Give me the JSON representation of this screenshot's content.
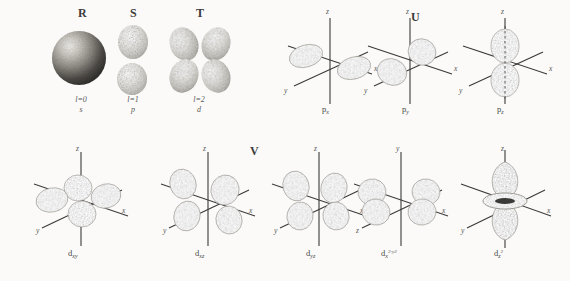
{
  "figure": {
    "title_labels": [
      {
        "id": "R",
        "text": "R",
        "x": 78,
        "y": 10
      },
      {
        "id": "S",
        "text": "S",
        "x": 130,
        "y": 10
      },
      {
        "id": "T",
        "text": "T",
        "x": 196,
        "y": 10
      },
      {
        "id": "U",
        "text": "U",
        "x": 411,
        "y": 14
      },
      {
        "id": "V",
        "text": "V",
        "x": 250,
        "y": 147
      }
    ],
    "row1_captions": [
      {
        "quantum": "l=0",
        "symbol": "s",
        "x": 81,
        "y": 99
      },
      {
        "quantum": "l=1",
        "symbol": "p",
        "x": 133,
        "y": 99
      },
      {
        "quantum": "l=2",
        "symbol": "d",
        "x": 199,
        "y": 99
      }
    ],
    "orbitals": [
      {
        "name": "s-orbital-sphere",
        "type": "sphere",
        "label": "",
        "sub": "",
        "sup": "",
        "cx": 80,
        "cy": 58,
        "label_x": 0,
        "label_y": 0,
        "axes": []
      },
      {
        "name": "p-orbital-pair",
        "type": "p-vertical-pair",
        "label": "",
        "sub": "",
        "sup": "",
        "cx": 133,
        "cy": 58,
        "label_x": 0,
        "label_y": 0,
        "axes": []
      },
      {
        "name": "d-orbital-cloverleaf",
        "type": "d-clover",
        "label": "",
        "sub": "",
        "sup": "",
        "cx": 199,
        "cy": 58,
        "label_x": 0,
        "label_y": 0,
        "axes": []
      },
      {
        "name": "p-x-orbital",
        "type": "px",
        "label": "p",
        "sub": "x",
        "sup": "",
        "cx": 330,
        "cy": 60,
        "label_x": 322,
        "label_y": 110,
        "axes": [
          {
            "t": "z",
            "x": 326,
            "y": 11
          },
          {
            "t": "x",
            "y": 70,
            "x": 374
          },
          {
            "t": "y",
            "x": 286,
            "y": 92
          }
        ]
      },
      {
        "name": "p-y-orbital",
        "type": "py",
        "label": "p",
        "sub": "y",
        "sup": "",
        "cx": 410,
        "cy": 60,
        "label_x": 402,
        "label_y": 110,
        "axes": [
          {
            "t": "z",
            "x": 406,
            "y": 11
          },
          {
            "t": "x",
            "y": 70,
            "x": 454
          },
          {
            "t": "y",
            "x": 366,
            "y": 92
          }
        ]
      },
      {
        "name": "p-z-orbital",
        "type": "pz",
        "label": "p",
        "sub": "z",
        "sup": "",
        "cx": 505,
        "cy": 60,
        "label_x": 497,
        "label_y": 110,
        "axes": [
          {
            "t": "z",
            "x": 501,
            "y": 11
          },
          {
            "t": "x",
            "y": 70,
            "x": 549
          },
          {
            "t": "y",
            "x": 461,
            "y": 92
          }
        ]
      },
      {
        "name": "d-xy-orbital",
        "type": "dxy",
        "label": "d",
        "sub": "xy",
        "sup": "",
        "cx": 80,
        "cy": 200,
        "label_x": 68,
        "label_y": 252,
        "axes": [
          {
            "t": "z",
            "x": 76,
            "y": 148
          },
          {
            "t": "x",
            "y": 210,
            "x": 124
          },
          {
            "t": "y",
            "x": 36,
            "y": 230
          }
        ]
      },
      {
        "name": "d-xz-orbital",
        "type": "dxz",
        "label": "d",
        "sub": "xz",
        "sup": "",
        "cx": 207,
        "cy": 200,
        "label_x": 195,
        "label_y": 252,
        "axes": [
          {
            "t": "z",
            "x": 203,
            "y": 148
          },
          {
            "t": "x",
            "y": 210,
            "x": 251
          },
          {
            "t": "y",
            "x": 163,
            "y": 230
          }
        ]
      },
      {
        "name": "d-yz-orbital",
        "type": "dyz",
        "label": "d",
        "sub": "yz",
        "sup": "",
        "cx": 318,
        "cy": 200,
        "label_x": 306,
        "label_y": 252,
        "axes": [
          {
            "t": "z",
            "x": 314,
            "y": 148
          },
          {
            "t": "x",
            "y": 210,
            "x": 362
          },
          {
            "t": "y",
            "x": 274,
            "y": 230
          }
        ]
      },
      {
        "name": "d-x2-y2-orbital",
        "type": "dx2y2",
        "label": "d",
        "sub": "x",
        "sup": "2-y2",
        "cx": 400,
        "cy": 200,
        "label_x": 383,
        "label_y": 252,
        "axes": [
          {
            "t": "y",
            "x": 396,
            "y": 148
          },
          {
            "t": "x",
            "y": 210,
            "x": 444
          },
          {
            "t": "z",
            "x": 356,
            "y": 230
          }
        ]
      },
      {
        "name": "d-z2-orbital",
        "type": "dz2",
        "label": "d",
        "sub": "z",
        "sup": "2",
        "cx": 505,
        "cy": 200,
        "label_x": 494,
        "label_y": 252,
        "axes": [
          {
            "t": "z",
            "x": 501,
            "y": 148
          },
          {
            "t": "x",
            "y": 210,
            "x": 549
          },
          {
            "t": "y",
            "x": 461,
            "y": 230
          }
        ]
      }
    ],
    "axis_text": {
      "z": "z",
      "x": "x",
      "y": "y"
    },
    "colors": {
      "background": "#fbfaf8",
      "ink": "#4a4a4a",
      "axis": "#3a3a3a",
      "lobe_light": "#d9d6d0",
      "lobe_mid": "#a8a49c",
      "lobe_dark": "#6f6b64",
      "sphere_dark": "#3c3a38"
    }
  }
}
